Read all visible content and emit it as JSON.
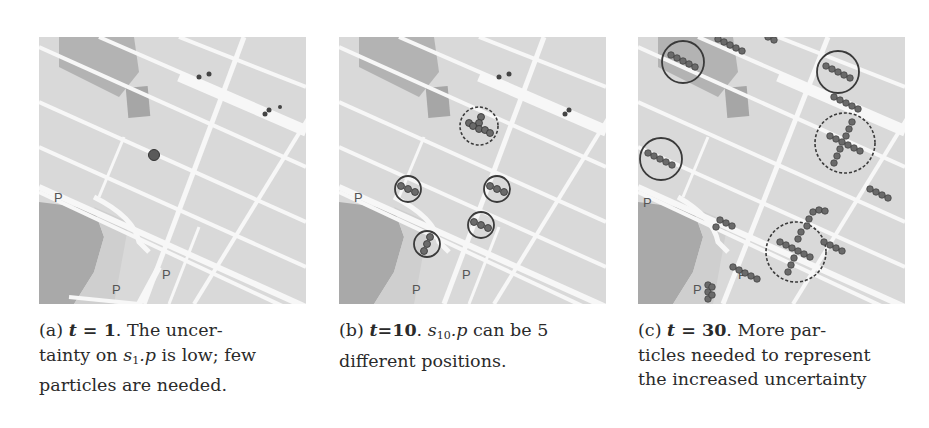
{
  "figure": {
    "panels": [
      {
        "id": "a",
        "label": "(a)",
        "t_var": "t",
        "eq": "=",
        "t_value": "1",
        "caption_rest_line1": ". The uncer-",
        "caption_line2_pre": "tainty on ",
        "state_var": "s",
        "state_sub": "1",
        "state_attr": ".p",
        "caption_line2_post": " is low; few",
        "caption_line3": "particles are needed."
      },
      {
        "id": "b",
        "label": "(b)",
        "t_var": "t",
        "eq": "=",
        "t_value": "10",
        "caption_rest_line1_pre": ". ",
        "state_var": "s",
        "state_sub": "10",
        "state_attr": ".p",
        "caption_rest_line1_post": " can be 5",
        "caption_line2": "different positions."
      },
      {
        "id": "c",
        "label": "(c)",
        "t_var": "t",
        "eq": "=",
        "t_value": "30",
        "caption_rest_line1": ". More par-",
        "caption_line2": "ticles needed to represent",
        "caption_line3": "the increased uncertainty"
      }
    ],
    "map_labels": {
      "park_top": "Parc Émilie-Gamelin",
      "park_left": "Place Longueuil",
      "parking": "P",
      "streets": [
        "Rue Sherbrooke",
        "Boulevard Dulac",
        "Rue de l'Hôtel-de-Ville",
        "Rue Saint-Antoine",
        "Rue Garibaldi",
        "Rue Jolicoeur",
        "Rue d'Aberdeen",
        "Rue Marquette",
        "Rue Saint-Laurent Ouest"
      ]
    },
    "colors": {
      "map_bg": "#d9d9d9",
      "road": "#f7f7f7",
      "park": "#a9a9a9",
      "building": "#bdbdbd",
      "particle": "#6a6a6a",
      "circle": "#3a3a3a"
    }
  }
}
